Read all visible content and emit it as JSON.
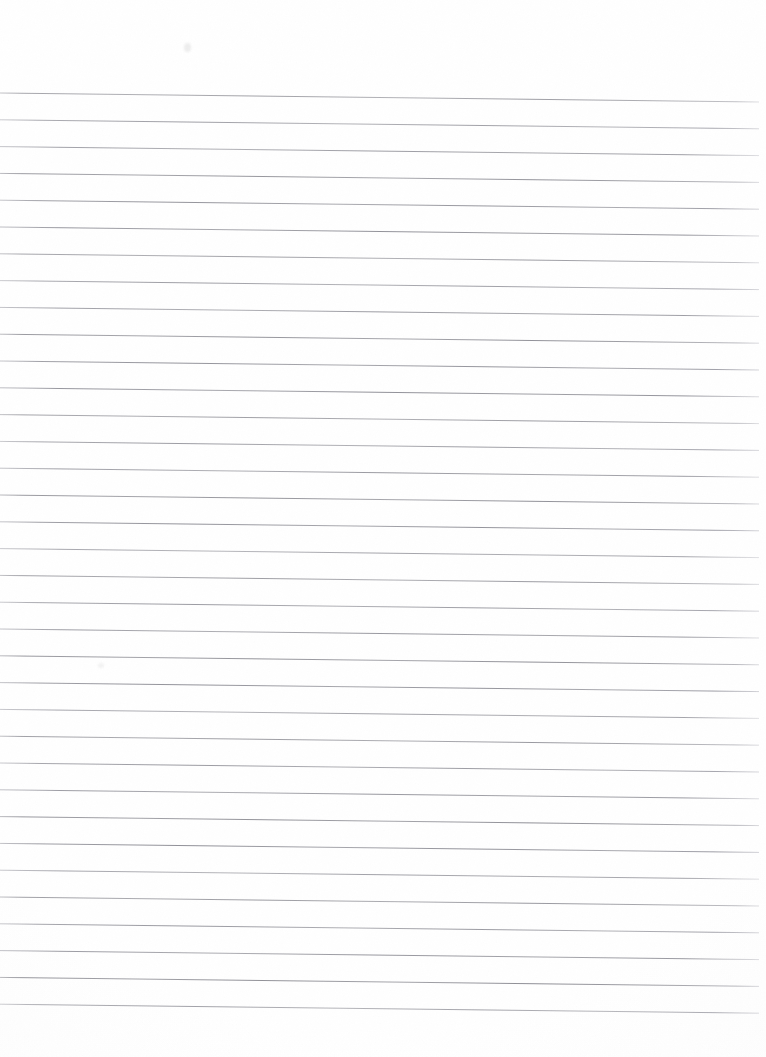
{
  "document": {
    "kind": "scanned-lined-paper",
    "title": "Blank ruled notebook page (scan)",
    "page_width": 766,
    "page_height": 1057,
    "content_text": "",
    "written_content": "none — page is blank",
    "background_color": "#ffffff",
    "paper_tint": "#fdfdfd"
  },
  "ruling": {
    "line_color": "#9a9a9f",
    "line_color_dark": "#7c7c84",
    "line_color_light": "#c3c3c8",
    "line_count": 35,
    "line_thickness_px": 1,
    "spacing_px": 26.8,
    "first_line_y_left": 93,
    "last_line_y_left": 1005,
    "line_x_start": 0,
    "line_x_end": 759,
    "skew_drop_px": 9,
    "skew_degrees": 0.67,
    "top_margin_px": 93,
    "bottom_margin_px": 44,
    "right_margin_px": 7,
    "left_margin_px": 0
  },
  "artifacts": {
    "smudges": [
      {
        "name": "faint-speck-top",
        "x": 184,
        "y": 43,
        "w": 7,
        "h": 9,
        "color": "#eeeeee"
      },
      {
        "name": "faint-speck-mid",
        "x": 98,
        "y": 663,
        "w": 6,
        "h": 5,
        "color": "#f2f2f2"
      }
    ],
    "edge_vignette": "#fbfbfc"
  },
  "chart_data": {
    "type": "table",
    "categories": [],
    "values": [],
    "xlabel": "",
    "ylabel": ""
  }
}
